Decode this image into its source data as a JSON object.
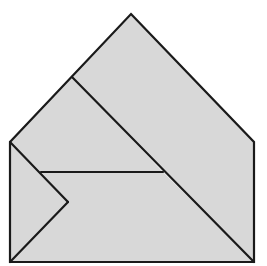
{
  "diagram": {
    "title": "House-shaped pentagon dissected into four pieces",
    "canvas": {
      "width": 267,
      "height": 266
    },
    "colors": {
      "background": "#ffffff",
      "fill": "#d8d8d8",
      "stroke": "#1a1a1a"
    },
    "stroke_width": 2.2,
    "vertices": {
      "apex": [
        131,
        14
      ],
      "left_eave": [
        10,
        142
      ],
      "right_eave": [
        254,
        142
      ],
      "bottom_left": [
        10,
        262
      ],
      "bottom_right": [
        254,
        262
      ],
      "roof_junction": [
        72,
        77
      ],
      "shelf_left": [
        41,
        172
      ],
      "shelf_right": [
        163,
        172
      ],
      "notch": [
        68,
        202
      ]
    },
    "outline": [
      "apex",
      "right_eave",
      "bottom_right",
      "bottom_left",
      "left_eave"
    ],
    "segments": [
      {
        "name": "main-diagonal",
        "from": "roof_junction",
        "to": "bottom_right"
      },
      {
        "name": "shelf-line",
        "from": "shelf_left",
        "to": "shelf_right"
      },
      {
        "name": "notch-upper",
        "from": "left_eave",
        "to": "notch"
      },
      {
        "name": "notch-lower",
        "from": "notch",
        "to": "bottom_left"
      }
    ],
    "pieces": [
      {
        "name": "right-large-piece",
        "vertices": [
          "apex",
          "right_eave",
          "bottom_right",
          "roof_junction"
        ]
      },
      {
        "name": "upper-left-piece",
        "vertices": [
          "roof_junction",
          "shelf_right",
          "shelf_left",
          "left_eave"
        ]
      },
      {
        "name": "lower-middle-piece",
        "vertices": [
          "shelf_left",
          "shelf_right",
          "bottom_right",
          "bottom_left",
          "notch"
        ]
      },
      {
        "name": "left-notch-piece",
        "vertices": [
          "left_eave",
          "notch",
          "bottom_left"
        ]
      }
    ]
  }
}
